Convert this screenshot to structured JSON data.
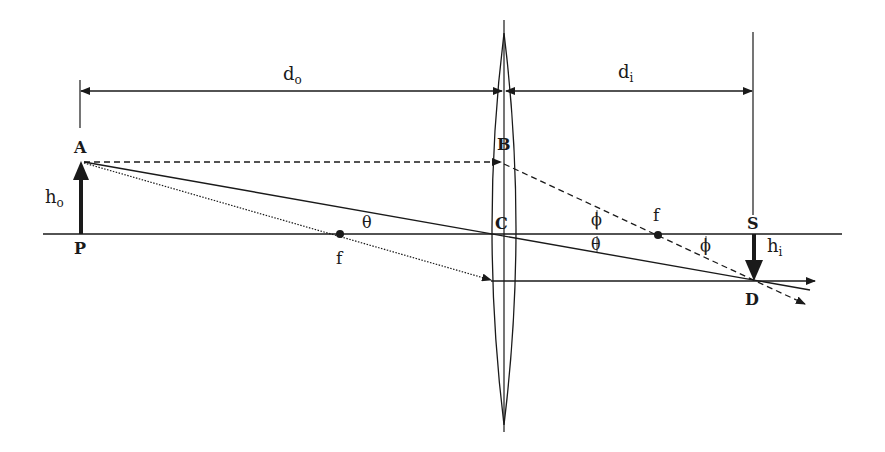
{
  "diagram": {
    "labels": {
      "d_o": "d",
      "d_o_sub": "o",
      "d_i": "d",
      "d_i_sub": "i",
      "h_o": "h",
      "h_o_sub": "o",
      "h_i": "h",
      "h_i_sub": "i",
      "A": "A",
      "B": "B",
      "C": "C",
      "D": "D",
      "P": "P",
      "S": "S",
      "f_left": "f",
      "f_right": "f",
      "theta_left": "θ",
      "theta_right": "θ",
      "phi_upper": "ϕ",
      "phi_right": "ϕ"
    },
    "colors": {
      "ink": "#1a1a1a",
      "background": "#ffffff"
    }
  }
}
